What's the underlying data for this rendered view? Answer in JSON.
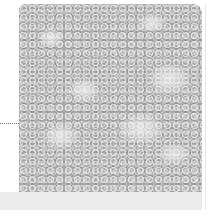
{
  "figure": {
    "image_kind": "grayscale-microscopy-cell-texture",
    "leader_line": "dotted",
    "colors": {
      "background": "#ffffff",
      "image_base": "#b4b4b4",
      "band": "#ececec",
      "leader": "#6e6e6e"
    }
  }
}
